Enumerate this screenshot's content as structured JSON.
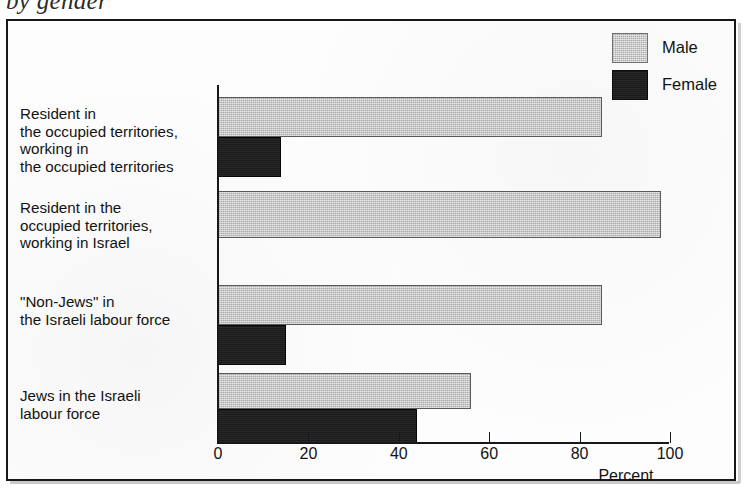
{
  "caption": {
    "text": "by gender"
  },
  "legend": {
    "position": "top-right",
    "entries": [
      {
        "label": "Male",
        "swatch": "male-swatch-icon",
        "color": "#c9c9c9"
      },
      {
        "label": "Female",
        "swatch": "female-swatch-icon",
        "color": "#191919"
      }
    ]
  },
  "axis": {
    "x_title": "Percent",
    "ticks": [
      "0",
      "20",
      "40",
      "60",
      "80",
      "100"
    ]
  },
  "categories": [
    "Resident in\nthe occupied territories,\nworking in\nthe occupied territories",
    "Resident in the\noccupied territories,\nworking in Israel",
    "\"Non-Jews\" in\nthe Israeli labour force",
    "Jews in the Israeli\nlabour force"
  ],
  "chart_data": {
    "type": "bar",
    "orientation": "horizontal",
    "title": "by gender",
    "xlabel": "Percent",
    "ylabel": "",
    "xlim": [
      0,
      100
    ],
    "xticks": [
      0,
      20,
      40,
      60,
      80,
      100
    ],
    "grid": false,
    "legend_position": "top-right",
    "categories": [
      "Resident in the occupied territories, working in the occupied territories",
      "Resident in the occupied territories, working in Israel",
      "\"Non-Jews\" in the Israeli labour force",
      "Jews in the Israeli labour force"
    ],
    "series": [
      {
        "name": "Male",
        "color": "#c9c9c9",
        "values": [
          85,
          98,
          85,
          56
        ]
      },
      {
        "name": "Female",
        "color": "#191919",
        "values": [
          14,
          0,
          15,
          44
        ]
      }
    ]
  }
}
